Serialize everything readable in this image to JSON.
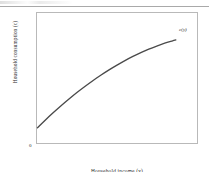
{
  "figure": {
    "origin_label": "0",
    "curve_label": "c(y)",
    "x_axis_label": "Household income (y)",
    "y_axis_label": "Household consumption (c)"
  },
  "style": {
    "curve_color": "#4a4a4a",
    "frame_color": "#b9b9b9",
    "text_color": "#2b2b2b",
    "background": "#ffffff"
  },
  "chart_data": {
    "type": "line",
    "title": "",
    "xlabel": "Household income (y)",
    "ylabel": "Household consumption (c)",
    "xlim": [
      0,
      1
    ],
    "ylim": [
      0,
      1
    ],
    "grid": false,
    "legend": "none",
    "annotations": [
      {
        "text": "c(y)",
        "x": 0.88,
        "y": 0.8
      },
      {
        "text": "0",
        "x": 0.0,
        "y": 0.0
      }
    ],
    "series": [
      {
        "name": "c(y)",
        "description": "Concave consumption function: positive intercept, diminishing marginal propensity to consume",
        "x": [
          0.0,
          0.05,
          0.1,
          0.15,
          0.2,
          0.25,
          0.3,
          0.35,
          0.4,
          0.45,
          0.5,
          0.55,
          0.6,
          0.65,
          0.7,
          0.75,
          0.8,
          0.85,
          0.87
        ],
        "y": [
          0.115,
          0.175,
          0.232,
          0.287,
          0.339,
          0.389,
          0.436,
          0.481,
          0.523,
          0.563,
          0.6,
          0.635,
          0.667,
          0.697,
          0.724,
          0.748,
          0.77,
          0.788,
          0.795
        ]
      }
    ]
  }
}
